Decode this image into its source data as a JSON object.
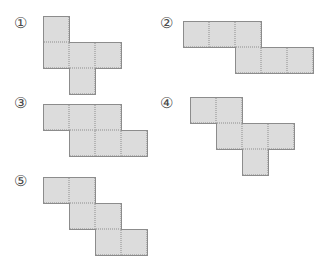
{
  "page": {
    "background_color": "#ffffff",
    "width": 304,
    "height": 255
  },
  "style": {
    "cell_size": 26,
    "cell_fill": "#dcdcdc",
    "inner_line_color": "#b4b4b4",
    "outline_color": "#8c8c8c",
    "label_color": "#4a4a4a"
  },
  "options": [
    {
      "id": "option-1",
      "label": "①",
      "label_x": 14,
      "label_y": 16,
      "origin_x": 43,
      "origin_y": 16,
      "cells": [
        {
          "col": 0,
          "row": 0
        },
        {
          "col": 0,
          "row": 1
        },
        {
          "col": 1,
          "row": 1
        },
        {
          "col": 2,
          "row": 1
        },
        {
          "col": 1,
          "row": 2
        }
      ],
      "cell_count": 5
    },
    {
      "id": "option-2",
      "label": "②",
      "label_x": 160,
      "label_y": 16,
      "origin_x": 183,
      "origin_y": 21,
      "cells": [
        {
          "col": 0,
          "row": 0
        },
        {
          "col": 1,
          "row": 0
        },
        {
          "col": 2,
          "row": 0
        },
        {
          "col": 2,
          "row": 1
        },
        {
          "col": 3,
          "row": 1
        },
        {
          "col": 4,
          "row": 1
        }
      ],
      "cell_count": 6
    },
    {
      "id": "option-3",
      "label": "③",
      "label_x": 14,
      "label_y": 96,
      "origin_x": 43,
      "origin_y": 104,
      "cells": [
        {
          "col": 0,
          "row": 0
        },
        {
          "col": 1,
          "row": 0
        },
        {
          "col": 2,
          "row": 0
        },
        {
          "col": 1,
          "row": 1
        },
        {
          "col": 2,
          "row": 1
        },
        {
          "col": 3,
          "row": 1
        }
      ],
      "cell_count": 6
    },
    {
      "id": "option-4",
      "label": "④",
      "label_x": 160,
      "label_y": 96,
      "origin_x": 190,
      "origin_y": 97,
      "cells": [
        {
          "col": 0,
          "row": 0
        },
        {
          "col": 1,
          "row": 0
        },
        {
          "col": 1,
          "row": 1
        },
        {
          "col": 2,
          "row": 1
        },
        {
          "col": 3,
          "row": 1
        },
        {
          "col": 2,
          "row": 2
        }
      ],
      "cell_count": 6
    },
    {
      "id": "option-5",
      "label": "⑤",
      "label_x": 14,
      "label_y": 174,
      "origin_x": 43,
      "origin_y": 177,
      "cells": [
        {
          "col": 0,
          "row": 0
        },
        {
          "col": 1,
          "row": 0
        },
        {
          "col": 1,
          "row": 1
        },
        {
          "col": 2,
          "row": 1
        },
        {
          "col": 2,
          "row": 2
        },
        {
          "col": 3,
          "row": 2
        }
      ],
      "cell_count": 6
    }
  ]
}
